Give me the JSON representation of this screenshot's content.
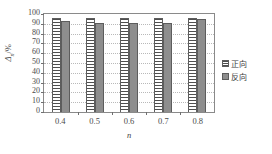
{
  "chart_data": {
    "type": "bar",
    "title": "",
    "xlabel": "n",
    "ylabel": "Δn/%",
    "ylabel_symbol": "Δ",
    "ylabel_sub": "n",
    "ylabel_unit": "/%",
    "categories": [
      "0.4",
      "0.5",
      "0.6",
      "0.7",
      "0.8"
    ],
    "series": [
      {
        "name": "正向",
        "values": [
          95.5,
          95.5,
          95.5,
          95.5,
          95.5
        ],
        "pattern": "horizontal-hatch",
        "color": "#fdfdfd"
      },
      {
        "name": "反向",
        "values": [
          93.0,
          91.0,
          90.5,
          91.0,
          94.5
        ],
        "pattern": "solid",
        "color": "#8e8e8e"
      }
    ],
    "ylim": [
      0,
      100
    ],
    "ytick_step": 10,
    "yticks": [
      "100",
      "90",
      "80",
      "70",
      "60",
      "50",
      "40",
      "30",
      "20",
      "10",
      "0"
    ],
    "grid": true,
    "grid_style": "dotted-horizontal",
    "legend_position": "right"
  },
  "legend": {
    "items": [
      {
        "label": "正向",
        "swatch": "hatched-swatch"
      },
      {
        "label": "反向",
        "swatch": "solid-gray-swatch"
      }
    ]
  },
  "axis": {
    "frame_color": "#8a8a8a",
    "grid_color": "#b9b9b9",
    "text_color": "#4a4a4a"
  }
}
